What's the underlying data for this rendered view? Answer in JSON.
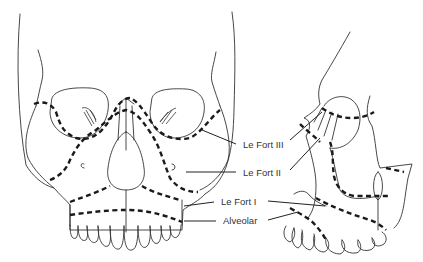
{
  "diagram": {
    "views": [
      "frontal",
      "lateral"
    ],
    "labels": [
      {
        "id": "lefort3",
        "text": "Le Fort III"
      },
      {
        "id": "lefort2",
        "text": "Le Fort II"
      },
      {
        "id": "lefort1",
        "text": "Le Fort I"
      },
      {
        "id": "alveolar",
        "text": "Alveolar"
      }
    ],
    "colors": {
      "line": "#333333",
      "fracture": "#1a1a1a",
      "background": "#ffffff"
    }
  }
}
